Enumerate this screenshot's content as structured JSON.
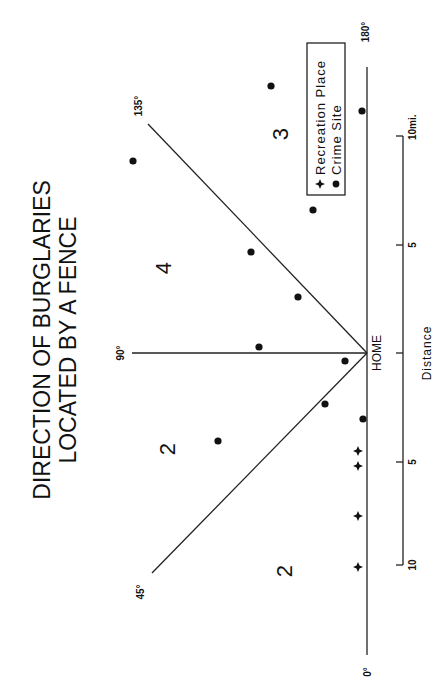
{
  "title": {
    "line1": "DIRECTION OF BURGLARIES",
    "line2": "LOCATED BY A FENCE"
  },
  "angles": {
    "a0": "0°",
    "a45": "45°",
    "a90": "90°",
    "a135": "135°",
    "a180": "180°"
  },
  "sectors": {
    "s0_45": "2",
    "s45_90": "2",
    "s90_135": "4",
    "s135_180": "3"
  },
  "home_label": "HOME",
  "legend": {
    "recreation": "Recreation Place",
    "crime": "Crime Site",
    "recreation_symbol": "✦",
    "crime_symbol": "●"
  },
  "scale": {
    "axis_label": "Distance",
    "left_10": "10",
    "left_5": "5",
    "right_5": "5",
    "right_10": "10mi."
  },
  "colors": {
    "ink": "#111111",
    "background": "#ffffff"
  },
  "points": {
    "crime_sites": [
      {
        "x": 133,
        "y": 161
      },
      {
        "x": 271,
        "y": 86
      },
      {
        "x": 362,
        "y": 111
      },
      {
        "x": 313,
        "y": 210
      },
      {
        "x": 251,
        "y": 252
      },
      {
        "x": 298,
        "y": 297
      },
      {
        "x": 259,
        "y": 347
      },
      {
        "x": 345,
        "y": 361
      },
      {
        "x": 325,
        "y": 404
      },
      {
        "x": 363,
        "y": 419
      },
      {
        "x": 218,
        "y": 441
      }
    ],
    "recreation_places": [
      {
        "x": 358,
        "y": 451
      },
      {
        "x": 358,
        "y": 466
      },
      {
        "x": 358,
        "y": 516
      },
      {
        "x": 358,
        "y": 567
      }
    ]
  }
}
